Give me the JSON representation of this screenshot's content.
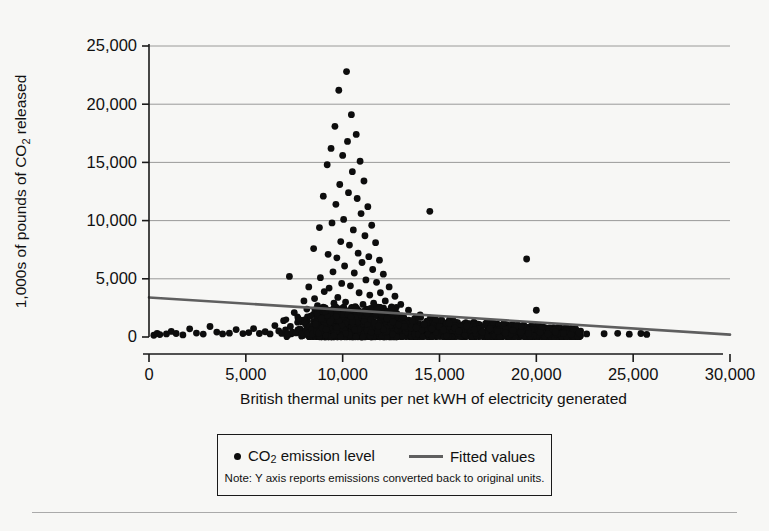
{
  "chart_data": {
    "type": "scatter",
    "title": "",
    "xlabel": "British thermal units per net kWH of electricity generated",
    "ylabel": "1,000s of pounds of CO2 released",
    "ylabel_html": "1,000s of pounds of CO<sub>2</sub> released",
    "xlim": [
      0,
      30000
    ],
    "ylim": [
      0,
      25000
    ],
    "xticks": [
      0,
      5000,
      10000,
      15000,
      20000,
      25000,
      30000
    ],
    "xticklabels": [
      "0",
      "5,000",
      "10,000",
      "15,000",
      "20,000",
      "25,000",
      "30,000"
    ],
    "yticks": [
      0,
      5000,
      10000,
      15000,
      20000,
      25000
    ],
    "yticklabels": [
      "0",
      "5,000",
      "10,000",
      "15,000",
      "20,000",
      "25,000"
    ],
    "grid": "horizontal",
    "legend_position": "below-plot",
    "marker_color": "#0d0d0d",
    "fit_color": "#5f5f5f",
    "series": [
      {
        "name": "CO2 emission level",
        "type": "scatter",
        "points": [
          [
            250,
            150
          ],
          [
            420,
            320
          ],
          [
            560,
            210
          ],
          [
            900,
            260
          ],
          [
            1150,
            480
          ],
          [
            1400,
            300
          ],
          [
            1750,
            180
          ],
          [
            2100,
            700
          ],
          [
            2450,
            340
          ],
          [
            2800,
            250
          ],
          [
            3150,
            900
          ],
          [
            3500,
            420
          ],
          [
            3800,
            260
          ],
          [
            4150,
            330
          ],
          [
            4500,
            640
          ],
          [
            4850,
            290
          ],
          [
            5150,
            380
          ],
          [
            5400,
            720
          ],
          [
            5700,
            300
          ],
          [
            6000,
            450
          ],
          [
            6250,
            260
          ],
          [
            6500,
            980
          ],
          [
            6700,
            520
          ],
          [
            6850,
            310
          ],
          [
            6950,
            1400
          ],
          [
            7050,
            600
          ],
          [
            7150,
            260
          ],
          [
            7250,
            5200
          ],
          [
            7300,
            900
          ],
          [
            7400,
            420
          ],
          [
            7500,
            2100
          ],
          [
            7600,
            350
          ],
          [
            7700,
            1600
          ],
          [
            7800,
            700
          ],
          [
            7900,
            280
          ],
          [
            8000,
            3100
          ],
          [
            8050,
            1200
          ],
          [
            8100,
            560
          ],
          [
            8150,
            2400
          ],
          [
            8200,
            340
          ],
          [
            8250,
            4300
          ],
          [
            8300,
            900
          ],
          [
            8350,
            1800
          ],
          [
            8400,
            620
          ],
          [
            8450,
            260
          ],
          [
            8500,
            7600
          ],
          [
            8550,
            3300
          ],
          [
            8600,
            1100
          ],
          [
            8650,
            480
          ],
          [
            8700,
            2700
          ],
          [
            8750,
            350
          ],
          [
            8800,
            9400
          ],
          [
            8850,
            5100
          ],
          [
            8900,
            1600
          ],
          [
            8950,
            760
          ],
          [
            9000,
            12100
          ],
          [
            9050,
            3900
          ],
          [
            9100,
            2200
          ],
          [
            9150,
            640
          ],
          [
            9200,
            14800
          ],
          [
            9250,
            7100
          ],
          [
            9300,
            4200
          ],
          [
            9350,
            1300
          ],
          [
            9400,
            16200
          ],
          [
            9450,
            9800
          ],
          [
            9500,
            5600
          ],
          [
            9550,
            2900
          ],
          [
            9600,
            18100
          ],
          [
            9650,
            11400
          ],
          [
            9700,
            6800
          ],
          [
            9750,
            3400
          ],
          [
            9800,
            21200
          ],
          [
            9850,
            13100
          ],
          [
            9900,
            8200
          ],
          [
            9950,
            4600
          ],
          [
            10000,
            15600
          ],
          [
            10050,
            10100
          ],
          [
            10100,
            6100
          ],
          [
            10150,
            3000
          ],
          [
            10200,
            22800
          ],
          [
            10250,
            16800
          ],
          [
            10300,
            12400
          ],
          [
            10350,
            7900
          ],
          [
            10400,
            4400
          ],
          [
            10450,
            19100
          ],
          [
            10500,
            14200
          ],
          [
            10550,
            9200
          ],
          [
            10600,
            5500
          ],
          [
            10650,
            2600
          ],
          [
            10700,
            17400
          ],
          [
            10750,
            11900
          ],
          [
            10800,
            7200
          ],
          [
            10850,
            3800
          ],
          [
            10900,
            15100
          ],
          [
            10950,
            10600
          ],
          [
            11000,
            6400
          ],
          [
            11050,
            2800
          ],
          [
            11100,
            13400
          ],
          [
            11150,
            8700
          ],
          [
            11200,
            4900
          ],
          [
            11250,
            2000
          ],
          [
            11300,
            11200
          ],
          [
            11350,
            6900
          ],
          [
            11400,
            3600
          ],
          [
            11450,
            1500
          ],
          [
            11500,
            9600
          ],
          [
            11550,
            5800
          ],
          [
            11600,
            2900
          ],
          [
            11650,
            1200
          ],
          [
            11700,
            8100
          ],
          [
            11750,
            4700
          ],
          [
            11800,
            2300
          ],
          [
            11850,
            950
          ],
          [
            11900,
            6600
          ],
          [
            11950,
            3800
          ],
          [
            12000,
            1900
          ],
          [
            12100,
            5400
          ],
          [
            12200,
            3100
          ],
          [
            12300,
            1600
          ],
          [
            12400,
            4300
          ],
          [
            12500,
            2500
          ],
          [
            12600,
            1300
          ],
          [
            12700,
            3500
          ],
          [
            12800,
            2000
          ],
          [
            12900,
            1050
          ],
          [
            13000,
            2800
          ],
          [
            13100,
            1700
          ],
          [
            13200,
            900
          ],
          [
            13400,
            2300
          ],
          [
            13600,
            1400
          ],
          [
            13800,
            800
          ],
          [
            14000,
            1900
          ],
          [
            14200,
            1100
          ],
          [
            14500,
            10800
          ],
          [
            14600,
            700
          ],
          [
            14800,
            1500
          ],
          [
            15000,
            900
          ],
          [
            15200,
            600
          ],
          [
            15500,
            1200
          ],
          [
            15800,
            750
          ],
          [
            16000,
            500
          ],
          [
            16400,
            950
          ],
          [
            16800,
            600
          ],
          [
            17200,
            420
          ],
          [
            17600,
            700
          ],
          [
            18000,
            480
          ],
          [
            18400,
            350
          ],
          [
            18800,
            560
          ],
          [
            19200,
            400
          ],
          [
            19500,
            6700
          ],
          [
            19600,
            300
          ],
          [
            20000,
            2300
          ],
          [
            20200,
            380
          ],
          [
            20600,
            260
          ],
          [
            21000,
            440
          ],
          [
            21400,
            300
          ],
          [
            21800,
            220
          ],
          [
            22200,
            360
          ],
          [
            22600,
            260
          ],
          [
            23500,
            280
          ],
          [
            24200,
            320
          ],
          [
            24800,
            240
          ],
          [
            25400,
            300
          ],
          [
            25700,
            220
          ]
        ],
        "dense_band_note": "A very dense band of points lies between 0 and 1,500 across x = 7,000-22,000"
      },
      {
        "name": "Fitted values",
        "type": "line",
        "points": [
          [
            0,
            3400
          ],
          [
            30000,
            200
          ]
        ]
      }
    ]
  },
  "axes": {
    "ylabel": "1,000s of pounds of CO2 released",
    "xlabel": "British thermal units per net kWH of electricity generated"
  },
  "legend": {
    "scatter_label": "CO2 emission level",
    "line_label": "Fitted values",
    "note": "Note: Y axis reports emissions converted back to original units."
  }
}
